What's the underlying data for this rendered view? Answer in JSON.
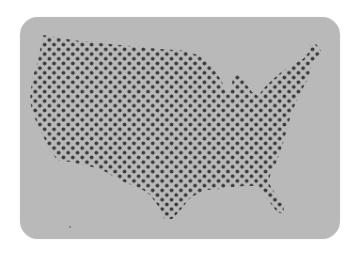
{
  "card": {
    "background": "#b9b9b9",
    "corner_radius": 18
  },
  "map": {
    "region": "United States (contiguous)",
    "style": "dot-matrix",
    "dot_color": "#3a3a3a",
    "dot_pitch_px": 9.4,
    "row_offset": "checkerboard"
  },
  "labels": {
    "map_title": "United States dot map"
  }
}
